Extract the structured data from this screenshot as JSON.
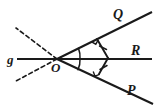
{
  "figure": {
    "background_color": "#ffffff",
    "stroke_color": "#1a1a1a",
    "labels": {
      "vertex": "O",
      "ray_upper": "Q",
      "ray_middle": "R",
      "ray_lower": "P",
      "line": "g"
    },
    "label_positions": {
      "vertex": {
        "x": 53,
        "y": 72
      },
      "ray_upper": {
        "x": 113,
        "y": 19
      },
      "ray_middle": {
        "x": 131,
        "y": 58
      },
      "ray_lower": {
        "x": 127,
        "y": 95
      },
      "line": {
        "x": 8,
        "y": 64
      }
    },
    "points": {
      "O": {
        "x": 57,
        "y": 59
      },
      "Q_end": {
        "x": 152,
        "y": 12
      },
      "R_end": {
        "x": 152,
        "y": 59
      },
      "P_end": {
        "x": 153,
        "y": 104
      },
      "g_end": {
        "x": 17,
        "y": 59
      },
      "dash_upper_end": {
        "x": 16,
        "y": 28
      },
      "dash_lower_end": {
        "x": 16,
        "y": 81
      },
      "foot_on_OQ": {
        "x": 97,
        "y": 39
      },
      "foot_on_OP": {
        "x": 99,
        "y": 74
      },
      "point_on_OR": {
        "x": 108,
        "y": 58
      }
    },
    "marks": {
      "right_angle_upper": "right-angle-square",
      "right_angle_lower": "right-angle-square",
      "tick_upper_segment": "single-tick",
      "tick_lower_segment": "single-tick",
      "angle_arc_upper": "single-arc",
      "angle_arc_lower": "single-arc"
    }
  }
}
